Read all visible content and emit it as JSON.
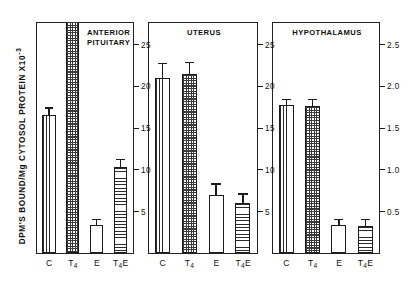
{
  "figure": {
    "ylabel": "DPM'S BOUND/Mg  CYTOSOL PROTEIN X10",
    "ylabel_exponent": "-3"
  },
  "chart_data": {
    "type": "bar",
    "title": "",
    "xlabel": "",
    "ylabel": "DPM'S BOUND/Mg CYTOSOL PROTEIN X10^-3",
    "grid": false,
    "legend_position": "none",
    "categories": [
      "C",
      "T4",
      "E",
      "T4E"
    ],
    "panels": [
      {
        "name": "anterior-pituitary",
        "title": "ANTERIOR\nPITUITARY",
        "axis_side": "right",
        "ylim": [
          0,
          27.5
        ],
        "yticks": [
          5,
          10,
          15,
          20,
          25
        ],
        "ytick_labels": [
          "5",
          "10",
          "15",
          "20",
          "25"
        ],
        "values": [
          16.5,
          27.5,
          3.3,
          10.3
        ],
        "errors": [
          0.8,
          0.0,
          0.6,
          0.8
        ],
        "off_scale": [
          false,
          true,
          false,
          false
        ],
        "patterns": [
          "vertical",
          "check",
          "open",
          "horizontal"
        ]
      },
      {
        "name": "uterus",
        "title": "UTERUS",
        "axis_side": "left",
        "ylim": [
          0,
          27.5
        ],
        "yticks": [
          5,
          10,
          15,
          20,
          25
        ],
        "ytick_labels": [
          "5",
          "10",
          "15",
          "20",
          "25"
        ],
        "values": [
          21.0,
          21.5,
          7.0,
          6.0
        ],
        "errors": [
          1.6,
          1.3,
          1.2,
          1.0
        ],
        "off_scale": [
          false,
          false,
          false,
          false
        ],
        "patterns": [
          "vertical",
          "check",
          "open",
          "horizontal"
        ]
      },
      {
        "name": "hypothalamus",
        "title": "HYPOTHALAMUS",
        "axis_side": "both",
        "ylim": [
          0,
          27.5
        ],
        "yticks": [
          5,
          10,
          15,
          20,
          25
        ],
        "ytick_labels": [
          "5",
          "10",
          "15",
          "20",
          "25"
        ],
        "right_axis": {
          "ylim": [
            0,
            2.75
          ],
          "yticks": [
            0.5,
            1.0,
            1.5,
            2.0,
            2.5
          ],
          "ytick_labels": [
            "0.5",
            "1.0",
            "1.5",
            "2.0",
            "2.5"
          ]
        },
        "values": [
          17.8,
          17.6,
          3.3,
          3.2
        ],
        "errors": [
          0.55,
          0.75,
          0.6,
          0.7
        ],
        "off_scale": [
          false,
          false,
          false,
          false
        ],
        "patterns": [
          "vertical",
          "check",
          "open",
          "horizontal"
        ]
      }
    ],
    "xtick_labels": [
      {
        "main": "C",
        "sub": "",
        "tail": ""
      },
      {
        "main": "T",
        "sub": "4",
        "tail": ""
      },
      {
        "main": "E",
        "sub": "",
        "tail": ""
      },
      {
        "main": "T",
        "sub": "4",
        "tail": "E"
      }
    ]
  }
}
